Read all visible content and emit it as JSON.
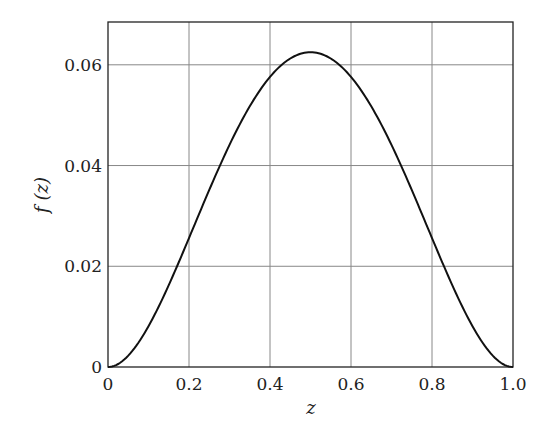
{
  "chart_data": {
    "type": "line",
    "title": "",
    "xlabel": "z",
    "ylabel": "f (z)",
    "xlim": [
      0,
      1.0
    ],
    "ylim": [
      0,
      0.0685
    ],
    "grid": true,
    "legend": null,
    "x_ticks": [
      "0",
      "0.2",
      "0.4",
      "0.6",
      "0.8",
      "1.0"
    ],
    "y_ticks": [
      "0",
      "0.02",
      "0.04",
      "0.06"
    ],
    "series": [
      {
        "name": "f(z)",
        "x": [
          0,
          0.05,
          0.1,
          0.15,
          0.2,
          0.25,
          0.3,
          0.35,
          0.4,
          0.45,
          0.5,
          0.55,
          0.6,
          0.65,
          0.7,
          0.75,
          0.8,
          0.85,
          0.9,
          0.95,
          1.0
        ],
        "values": [
          0,
          0.0023,
          0.0081,
          0.0163,
          0.0256,
          0.0352,
          0.0441,
          0.0518,
          0.0576,
          0.0613,
          0.0625,
          0.0613,
          0.0576,
          0.0518,
          0.0441,
          0.0352,
          0.0256,
          0.0163,
          0.0081,
          0.0023,
          0
        ]
      }
    ]
  }
}
